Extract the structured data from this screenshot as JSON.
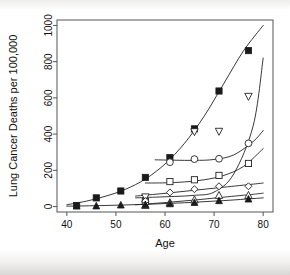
{
  "chart_data": {
    "type": "scatter",
    "title": "",
    "xlabel": "Age",
    "ylabel": "Lung Cancer Deaths per 100,000",
    "xlim": [
      38,
      82
    ],
    "ylim": [
      -30,
      1030
    ],
    "xticks": [
      40,
      50,
      60,
      70,
      80
    ],
    "yticks": [
      0,
      200,
      400,
      600,
      800,
      1000
    ],
    "grid": false,
    "legend": "none",
    "series": [
      {
        "name": "series-1",
        "marker": "filled-square",
        "x": [
          42,
          46,
          51,
          56,
          61,
          66,
          71,
          77
        ],
        "y": [
          6,
          48,
          86,
          161,
          270,
          429,
          638,
          861
        ],
        "fit_x": [
          40,
          44,
          48,
          52,
          56,
          60,
          64,
          68,
          72,
          76,
          80
        ],
        "fit_y": [
          10,
          30,
          58,
          96,
          152,
          235,
          350,
          500,
          680,
          860,
          1000
        ]
      },
      {
        "name": "series-2",
        "marker": "open-down-triangle",
        "x": [
          56,
          66,
          71,
          77
        ],
        "y": [
          53,
          413,
          415,
          608
        ],
        "fit_x": [
          54,
          58,
          62,
          66,
          70,
          74,
          78,
          80
        ],
        "fit_y": [
          48,
          52,
          56,
          62,
          80,
          180,
          450,
          820
        ]
      },
      {
        "name": "series-3",
        "marker": "open-circle",
        "x": [
          56,
          61,
          66,
          71,
          77
        ],
        "y": [
          26,
          245,
          262,
          264,
          349
        ],
        "fit_x": [
          58,
          62,
          66,
          70,
          74,
          78,
          80
        ],
        "fit_y": [
          258,
          256,
          255,
          260,
          285,
          360,
          420
        ]
      },
      {
        "name": "series-4",
        "marker": "open-square",
        "x": [
          56,
          61,
          66,
          71,
          77
        ],
        "y": [
          28,
          138,
          148,
          172,
          238
        ],
        "fit_x": [
          56,
          60,
          64,
          68,
          72,
          76,
          80
        ],
        "fit_y": [
          130,
          131,
          136,
          148,
          172,
          222,
          320
        ]
      },
      {
        "name": "series-5",
        "marker": "open-diamond",
        "x": [
          56,
          61,
          66,
          71,
          77
        ],
        "y": [
          30,
          78,
          96,
          112,
          112
        ],
        "fit_x": [
          54,
          60,
          66,
          72,
          78,
          80
        ],
        "fit_y": [
          58,
          73,
          90,
          107,
          124,
          130
        ]
      },
      {
        "name": "series-6",
        "marker": "open-up-triangle",
        "x": [
          56,
          61,
          66,
          71,
          77
        ],
        "y": [
          7,
          22,
          37,
          62,
          62
        ],
        "fit_x": [
          54,
          60,
          66,
          72,
          78,
          80
        ],
        "fit_y": [
          10,
          22,
          36,
          52,
          68,
          74
        ]
      },
      {
        "name": "series-7",
        "marker": "filled-triangle",
        "x": [
          42,
          46,
          51,
          56,
          61,
          66,
          71,
          77
        ],
        "y": [
          2,
          3,
          8,
          10,
          15,
          22,
          32,
          41
        ],
        "fit_x": [
          40,
          48,
          56,
          64,
          72,
          80
        ],
        "fit_y": [
          2,
          6,
          12,
          21,
          33,
          48
        ]
      }
    ]
  },
  "axes": {
    "x_title": "Age",
    "y_title": "Lung Cancer Deaths per 100,000",
    "x_tick_labels": [
      "40",
      "50",
      "60",
      "70",
      "80"
    ],
    "y_tick_labels": [
      "0",
      "200",
      "400",
      "600",
      "800",
      "1000"
    ]
  },
  "colors": {
    "marker_fill": "#1a1a1a",
    "marker_open": "#ffffff",
    "line": "#222222",
    "frame": "#555555",
    "background": "#ffffff"
  }
}
